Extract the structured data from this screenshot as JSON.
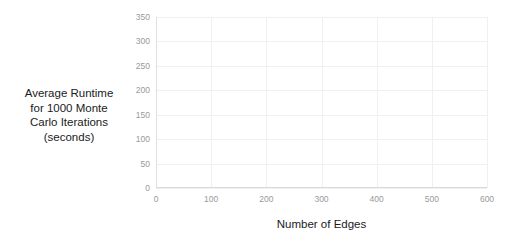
{
  "chart_data": {
    "type": "scatter",
    "title": "",
    "xlabel": "Number of Edges",
    "ylabel": "Average Runtime for 1000 Monte Carlo Iterations (seconds)",
    "ylabel_lines": [
      "Average Runtime",
      "for 1000 Monte",
      "Carlo Iterations",
      "(seconds)"
    ],
    "xlim": [
      0,
      600
    ],
    "ylim": [
      0,
      350
    ],
    "xticks": [
      0,
      100,
      200,
      300,
      400,
      500,
      600
    ],
    "yticks": [
      0,
      50,
      100,
      150,
      200,
      250,
      300,
      350
    ],
    "xtick_labels": [
      "0",
      "100",
      "200",
      "300",
      "400",
      "500",
      "600"
    ],
    "ytick_labels": [
      "0",
      "50",
      "100",
      "150",
      "200",
      "250",
      "300",
      "350"
    ],
    "grid": true,
    "legend": false,
    "marker_color": "#808080",
    "trendline_color": "#1a1a1a",
    "trendline_style": "dashed",
    "trendline_label": "exponential fit",
    "axis_color": "#9a9a9a",
    "gridline_color": "#f0f0f0",
    "series": [
      {
        "name": "Average runtime per edge count",
        "points": [
          [
            170,
            2
          ],
          [
            185,
            3
          ],
          [
            200,
            4
          ],
          [
            215,
            5
          ],
          [
            230,
            6
          ],
          [
            245,
            7
          ],
          [
            260,
            8
          ],
          [
            275,
            10
          ],
          [
            290,
            12
          ],
          [
            300,
            13
          ],
          [
            315,
            16
          ],
          [
            330,
            19
          ],
          [
            345,
            23
          ],
          [
            360,
            27
          ],
          [
            375,
            33
          ],
          [
            390,
            40
          ],
          [
            400,
            46
          ],
          [
            412,
            62
          ],
          [
            420,
            66
          ],
          [
            428,
            55
          ],
          [
            440,
            70
          ],
          [
            452,
            84
          ],
          [
            460,
            95
          ],
          [
            468,
            92
          ],
          [
            472,
            108
          ],
          [
            482,
            120
          ],
          [
            492,
            155
          ],
          [
            500,
            133
          ],
          [
            508,
            170
          ],
          [
            515,
            195
          ],
          [
            522,
            210
          ],
          [
            530,
            230
          ],
          [
            545,
            290
          ],
          [
            555,
            302
          ]
        ]
      }
    ],
    "trendline_points": [
      [
        170,
        2
      ],
      [
        200,
        3
      ],
      [
        230,
        5
      ],
      [
        260,
        8
      ],
      [
        290,
        12
      ],
      [
        320,
        18
      ],
      [
        350,
        27
      ],
      [
        380,
        41
      ],
      [
        410,
        61
      ],
      [
        440,
        92
      ],
      [
        470,
        137
      ],
      [
        500,
        190
      ],
      [
        525,
        240
      ],
      [
        545,
        290
      ],
      [
        558,
        320
      ]
    ]
  }
}
